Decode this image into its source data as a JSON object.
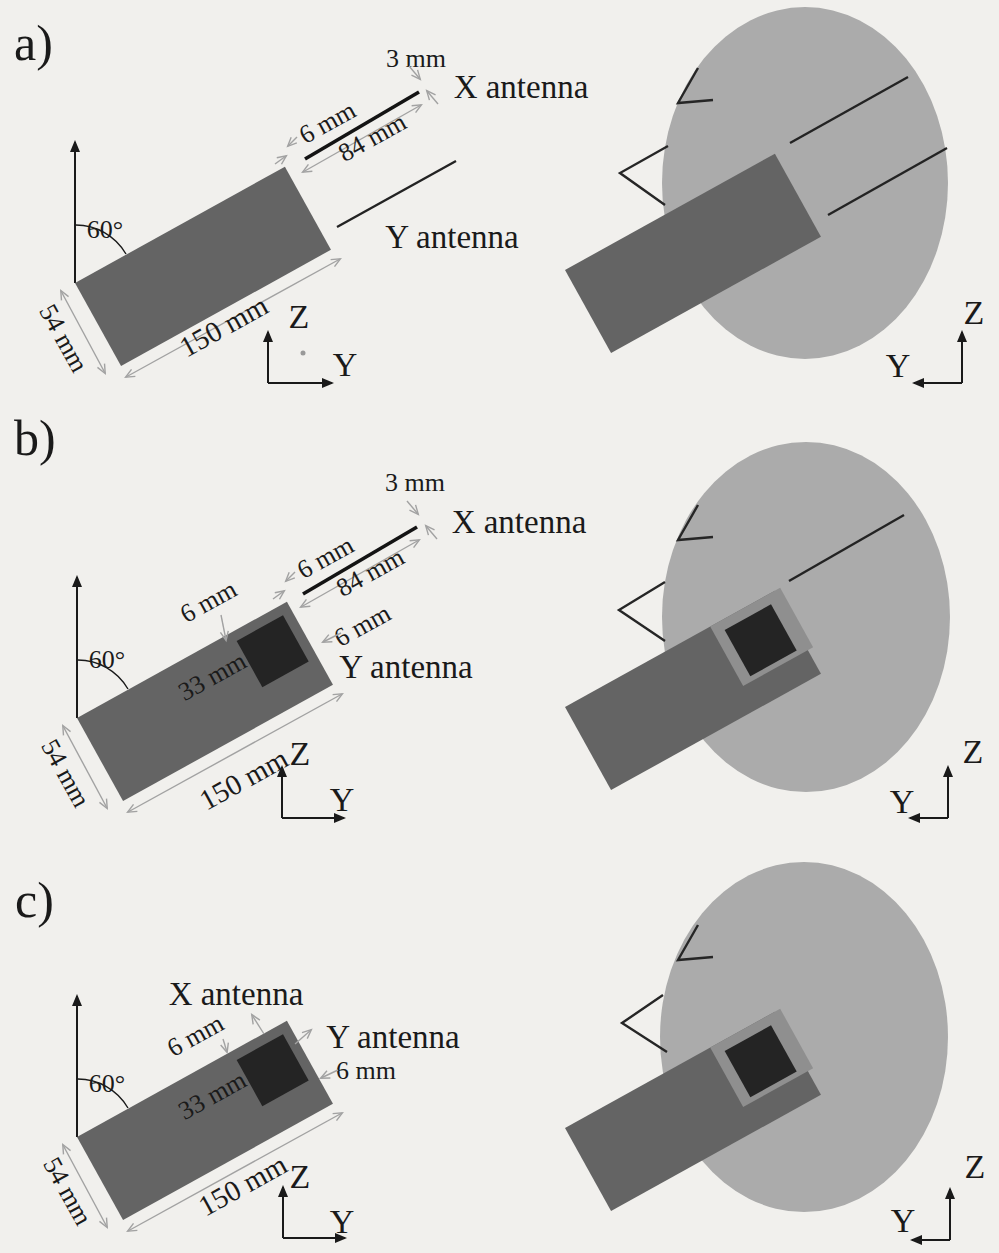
{
  "colors": {
    "background": "#f1f0ed",
    "body": "#ababab",
    "probe": "#646464",
    "window": "#8f8f8f",
    "square": "#242424"
  },
  "panels": {
    "a": {
      "label": "a)",
      "dims": {
        "angle": "60°",
        "width": "54 mm",
        "length": "150 mm",
        "tip_gap": "6 mm",
        "antenna_length": "84 mm",
        "end_offset": "3 mm"
      },
      "antennas": {
        "x": "X antenna",
        "y": "Y antenna"
      },
      "axes": {
        "z": "Z",
        "y": "Y"
      }
    },
    "b": {
      "label": "b)",
      "dims": {
        "angle": "60°",
        "width": "54 mm",
        "length": "150 mm",
        "tip_gap": "6 mm",
        "antenna_length": "84 mm",
        "end_offset": "3 mm",
        "loop_offset": "6 mm",
        "loop_side": "6 mm",
        "loop_position": "33 mm"
      },
      "antennas": {
        "x": "X antenna",
        "y": "Y antenna"
      },
      "axes": {
        "z": "Z",
        "y": "Y"
      }
    },
    "c": {
      "label": "c)",
      "dims": {
        "angle": "60°",
        "width": "54 mm",
        "length": "150 mm",
        "loop_offset": "6 mm",
        "loop_side": "6 mm",
        "loop_position": "33 mm"
      },
      "antennas": {
        "x": "X antenna",
        "y": "Y antenna"
      },
      "axes": {
        "z": "Z",
        "y": "Y"
      }
    }
  }
}
